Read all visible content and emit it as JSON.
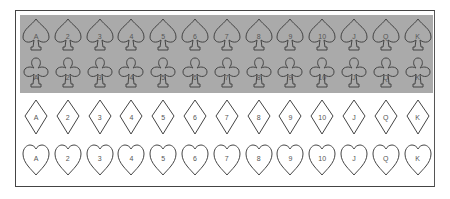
{
  "ranks": [
    "A",
    "2",
    "3",
    "4",
    "5",
    "6",
    "7",
    "8",
    "9",
    "10",
    "J",
    "Q",
    "K"
  ],
  "rows": [
    {
      "suit": "spade",
      "name": "spades",
      "top": 16,
      "labelTop": 17,
      "shaded": true
    },
    {
      "suit": "club",
      "name": "clubs",
      "top": 54,
      "labelTop": 20,
      "shaded": true
    },
    {
      "suit": "diamond",
      "name": "diamonds",
      "top": 98,
      "labelTop": 16,
      "shaded": false
    },
    {
      "suit": "heart",
      "name": "hearts",
      "top": 140,
      "labelTop": 15,
      "shaded": false
    }
  ],
  "colors": {
    "stroke": "#444444",
    "band": "#aaaaaa",
    "frame": "#444444"
  }
}
